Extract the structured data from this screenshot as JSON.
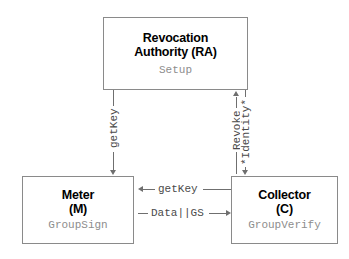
{
  "diagram": {
    "type": "flow-diagram",
    "background_color": "#ffffff",
    "line_color": "#6f6f6f",
    "box_border_color": "#8a8a8a",
    "title_color": "#000000",
    "sub_color": "#8d8d8d",
    "label_color": "#4a4a4a"
  },
  "nodes": [
    {
      "id": "ra",
      "title_line1": "Revocation",
      "title_line2": "Authority (RA)",
      "subtitle": "Setup"
    },
    {
      "id": "meter",
      "title_line1": "Meter",
      "title_line2": "(M)",
      "subtitle": "GroupSign"
    },
    {
      "id": "collector",
      "title_line1": "Collector",
      "title_line2": "(C)",
      "subtitle": "GroupVerify"
    }
  ],
  "edges": [
    {
      "id": "ra-to-meter",
      "label": "getKey",
      "from": "ra",
      "to": "meter",
      "direction": "down",
      "orientation": "vertical"
    },
    {
      "id": "collector-to-ra-revoke",
      "label": "Revoke",
      "from": "collector",
      "to": "ra",
      "direction": "up",
      "orientation": "vertical"
    },
    {
      "id": "ra-to-collector-identity",
      "label": "*Identity*",
      "from": "ra",
      "to": "collector",
      "direction": "down",
      "orientation": "vertical"
    },
    {
      "id": "collector-to-meter-getkey",
      "label": "getKey",
      "from": "collector",
      "to": "meter",
      "direction": "left",
      "orientation": "horizontal"
    },
    {
      "id": "meter-to-collector-data",
      "label": "Data||GS",
      "from": "meter",
      "to": "collector",
      "direction": "right",
      "orientation": "horizontal"
    }
  ]
}
